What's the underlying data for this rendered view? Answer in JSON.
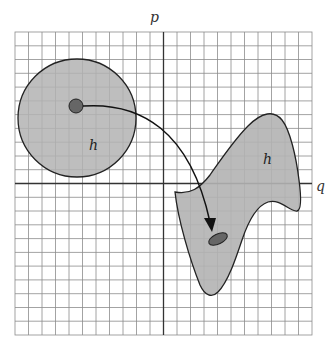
{
  "diagram": {
    "type": "phase-space-mapping",
    "axes": {
      "vertical_label": "p",
      "horizontal_label": "q"
    },
    "grid": {
      "left": 15,
      "top": 32,
      "right": 312,
      "bottom": 335,
      "columns": 22,
      "rows": 22
    },
    "regions": [
      {
        "name": "initial-region",
        "label": "h",
        "shape": "circle",
        "fill": "#b3b3b3"
      },
      {
        "name": "evolved-region",
        "label": "h",
        "shape": "distorted-blob",
        "fill": "#b3b3b3"
      }
    ],
    "points": [
      {
        "name": "start-point",
        "shape": "circle",
        "fill": "#666666"
      },
      {
        "name": "end-point",
        "shape": "ellipse",
        "fill": "#666666"
      }
    ],
    "arrow": {
      "from": "start-point",
      "to": "end-point"
    },
    "colors": {
      "grid_line": "#8c8c8c",
      "axis_line": "#333333",
      "region_fill": "#b3b3b3",
      "outline": "#222222",
      "point_fill": "#666666"
    }
  }
}
